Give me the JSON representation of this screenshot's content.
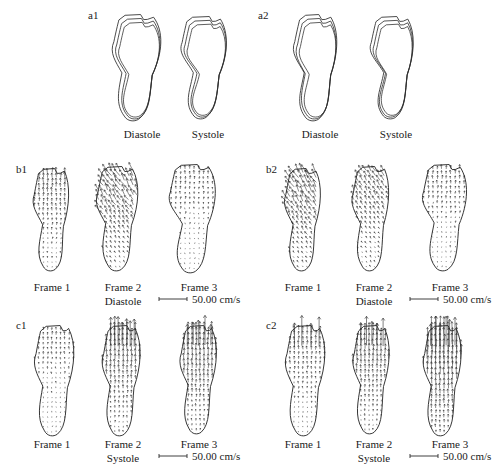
{
  "figure": {
    "background": "#ffffff",
    "ink": "#2b2b2b",
    "panels": [
      {
        "id": "a1",
        "letter": "a1",
        "type": "contours",
        "letter_pos": [
          88,
          10
        ],
        "items": [
          {
            "label": "Diastole",
            "label_pos": [
              142,
              128
            ],
            "shape_pos": [
              104,
              14
            ],
            "shape": "lv-a1-diastole"
          },
          {
            "label": "Systole",
            "label_pos": [
              208,
              128
            ],
            "shape_pos": [
              174,
              16
            ],
            "shape": "lv-a1-systole"
          }
        ]
      },
      {
        "id": "a2",
        "letter": "a2",
        "type": "contours",
        "letter_pos": [
          258,
          10
        ],
        "items": [
          {
            "label": "Diastole",
            "label_pos": [
              320,
              128
            ],
            "shape_pos": [
              284,
              14
            ],
            "shape": "lv-a2-diastole"
          },
          {
            "label": "Systole",
            "label_pos": [
              396,
              128
            ],
            "shape_pos": [
              362,
              16
            ],
            "shape": "lv-a2-systole"
          }
        ]
      },
      {
        "id": "b1",
        "letter": "b1",
        "type": "vectors",
        "phase": "Diastole",
        "phase_pos": [
          123,
          295
        ],
        "letter_pos": [
          16,
          164
        ],
        "scale_pos": [
          158,
          293
        ],
        "scale_label": "50.00 cm/s",
        "frames": [
          {
            "label": "Frame 1",
            "label_pos": [
              52,
              281
            ],
            "shape_pos": [
              26,
              168
            ],
            "shape": "lv-b1-f1",
            "field": "b1f1"
          },
          {
            "label": "Frame 2",
            "label_pos": [
              123,
              281
            ],
            "shape_pos": [
              90,
              166
            ],
            "shape": "lv-b1-f2",
            "field": "b1f2"
          },
          {
            "label": "Frame 3",
            "label_pos": [
              199,
              281
            ],
            "shape_pos": [
              162,
              164
            ],
            "shape": "lv-b1-f3",
            "field": "b1f3"
          }
        ]
      },
      {
        "id": "b2",
        "letter": "b2",
        "type": "vectors",
        "phase": "Diastole",
        "phase_pos": [
          374,
          295
        ],
        "letter_pos": [
          266,
          164
        ],
        "scale_pos": [
          409,
          293
        ],
        "scale_label": "50.00 cm/s",
        "frames": [
          {
            "label": "Frame 1",
            "label_pos": [
              303,
              281
            ],
            "shape_pos": [
              277,
              168
            ],
            "shape": "lv-b2-f1",
            "field": "b2f1"
          },
          {
            "label": "Frame 2",
            "label_pos": [
              374,
              281
            ],
            "shape_pos": [
              345,
              166
            ],
            "shape": "lv-b2-f2",
            "field": "b2f2"
          },
          {
            "label": "Frame 3",
            "label_pos": [
              450,
              281
            ],
            "shape_pos": [
              415,
              164
            ],
            "shape": "lv-b2-f3",
            "field": "b2f3"
          }
        ]
      },
      {
        "id": "c1",
        "letter": "c1",
        "type": "vectors",
        "phase": "Systole",
        "phase_pos": [
          123,
          452
        ],
        "letter_pos": [
          16,
          320
        ],
        "scale_pos": [
          158,
          450
        ],
        "scale_label": "50.00 cm/s",
        "frames": [
          {
            "label": "Frame 1",
            "label_pos": [
              52,
              438
            ],
            "shape_pos": [
              26,
              325
            ],
            "shape": "lv-c1-f1",
            "field": "c1f1"
          },
          {
            "label": "Frame 2",
            "label_pos": [
              123,
              438
            ],
            "shape_pos": [
              94,
              325
            ],
            "shape": "lv-c1-f2",
            "field": "c1f2"
          },
          {
            "label": "Frame 3",
            "label_pos": [
              199,
              438
            ],
            "shape_pos": [
              172,
              325
            ],
            "shape": "lv-c1-f3",
            "field": "c1f3"
          }
        ]
      },
      {
        "id": "c2",
        "letter": "c2",
        "type": "vectors",
        "phase": "Systole",
        "phase_pos": [
          374,
          452
        ],
        "letter_pos": [
          266,
          320
        ],
        "scale_pos": [
          409,
          450
        ],
        "scale_label": "50.00 cm/s",
        "frames": [
          {
            "label": "Frame 1",
            "label_pos": [
              303,
              438
            ],
            "shape_pos": [
              277,
              325
            ],
            "shape": "lv-c2-f1",
            "field": "c2f1"
          },
          {
            "label": "Frame 2",
            "label_pos": [
              374,
              438
            ],
            "shape_pos": [
              345,
              325
            ],
            "shape": "lv-c2-f2",
            "field": "c2f2"
          },
          {
            "label": "Frame 3",
            "label_pos": [
              450,
              438
            ],
            "shape_pos": [
              415,
              325
            ],
            "shape": "lv-c2-f3",
            "field": "c2f3"
          }
        ]
      }
    ]
  },
  "chart_data": {
    "type": "line",
    "xlabel": "",
    "ylabel": "",
    "grid": false,
    "legend": null,
    "panel_ids": [
      "a1",
      "a2",
      "b1",
      "b2",
      "c1",
      "c2"
    ],
    "frame_labels": [
      "Frame 1",
      "Frame 2",
      "Frame 3"
    ],
    "phase_labels": [
      "Diastole",
      "Systole"
    ],
    "scale_value": 50.0,
    "scale_units": "cm/s",
    "scale_text": "50.00 cm/s",
    "contours_per_panel": 3,
    "series": [
      {
        "name": "a1 Diastole contours",
        "panel": "a1",
        "n_contours": 3
      },
      {
        "name": "a1 Systole contours",
        "panel": "a1",
        "n_contours": 3
      },
      {
        "name": "a2 Diastole contours",
        "panel": "a2",
        "n_contours": 3
      },
      {
        "name": "a2 Systole contours",
        "panel": "a2",
        "n_contours": 3
      },
      {
        "name": "b1 Frame 1 velocity field",
        "panel": "b1",
        "phase": "Diastole",
        "grid_cols": 11,
        "grid_rows": 22,
        "mean_magnitude_rel": 0.3
      },
      {
        "name": "b1 Frame 2 velocity field",
        "panel": "b1",
        "phase": "Diastole",
        "grid_cols": 12,
        "grid_rows": 22,
        "mean_magnitude_rel": 0.55
      },
      {
        "name": "b1 Frame 3 velocity field",
        "panel": "b1",
        "phase": "Diastole",
        "grid_cols": 12,
        "grid_rows": 22,
        "mean_magnitude_rel": 0.18
      },
      {
        "name": "b2 Frame 1 velocity field",
        "panel": "b2",
        "phase": "Diastole",
        "grid_cols": 11,
        "grid_rows": 22,
        "mean_magnitude_rel": 0.6
      },
      {
        "name": "b2 Frame 2 velocity field",
        "panel": "b2",
        "phase": "Diastole",
        "grid_cols": 11,
        "grid_rows": 22,
        "mean_magnitude_rel": 0.4
      },
      {
        "name": "b2 Frame 3 velocity field",
        "panel": "b2",
        "phase": "Diastole",
        "grid_cols": 12,
        "grid_rows": 22,
        "mean_magnitude_rel": 0.2
      },
      {
        "name": "c1 Frame 1 velocity field",
        "panel": "c1",
        "phase": "Systole",
        "grid_cols": 12,
        "grid_rows": 23,
        "mean_magnitude_rel": 0.16
      },
      {
        "name": "c1 Frame 2 velocity field",
        "panel": "c1",
        "phase": "Systole",
        "grid_cols": 12,
        "grid_rows": 23,
        "mean_magnitude_rel": 0.45
      },
      {
        "name": "c1 Frame 3 velocity field",
        "panel": "c1",
        "phase": "Systole",
        "grid_cols": 12,
        "grid_rows": 23,
        "mean_magnitude_rel": 0.5
      },
      {
        "name": "c2 Frame 1 velocity field",
        "panel": "c2",
        "phase": "Systole",
        "grid_cols": 12,
        "grid_rows": 23,
        "mean_magnitude_rel": 0.25
      },
      {
        "name": "c2 Frame 2 velocity field",
        "panel": "c2",
        "phase": "Systole",
        "grid_cols": 12,
        "grid_rows": 23,
        "mean_magnitude_rel": 0.42
      },
      {
        "name": "c2 Frame 3 velocity field",
        "panel": "c2",
        "phase": "Systole",
        "grid_cols": 12,
        "grid_rows": 23,
        "mean_magnitude_rel": 0.85
      }
    ]
  },
  "labels": {
    "a1": "a1",
    "a2": "a2",
    "b1": "b1",
    "b2": "b2",
    "c1": "c1",
    "c2": "c2",
    "diastole": "Diastole",
    "systole": "Systole",
    "frame1": "Frame 1",
    "frame2": "Frame 2",
    "frame3": "Frame 3",
    "scale": "50.00 cm/s"
  }
}
